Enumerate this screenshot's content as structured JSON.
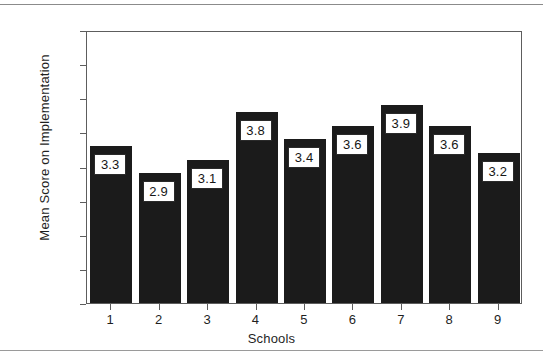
{
  "chart_data": {
    "type": "bar",
    "title": "",
    "xlabel": "Schools",
    "ylabel": "Mean Score on Implementation",
    "categories": [
      "1",
      "2",
      "3",
      "4",
      "5",
      "6",
      "7",
      "8",
      "9"
    ],
    "values": [
      3.3,
      2.9,
      3.1,
      3.8,
      3.4,
      3.6,
      3.9,
      3.6,
      3.2
    ],
    "value_labels": [
      "3.3",
      "2.9",
      "3.1",
      "3.8",
      "3.4",
      "3.6",
      "3.9",
      "3.6",
      "3.2"
    ],
    "ylim": [
      1.0,
      5.0
    ],
    "ytick_labels": [
      "1.0",
      "1.5",
      "2.0",
      "2.5",
      "3.0",
      "3.5",
      "4.0",
      "4.5",
      "5.0"
    ],
    "ytick_values": [
      1.0,
      1.5,
      2.0,
      2.5,
      3.0,
      3.5,
      4.0,
      4.5,
      5.0
    ],
    "grid": false,
    "legend": false,
    "bar_color": "#1b1b1b",
    "label_box_fill": "#ffffff",
    "label_box_border": "#2a2a2a",
    "axis_color": "#5d5d5d",
    "background": "#ffffff"
  },
  "page": {
    "top_rule_color": "#8b8b8b",
    "bottom_rule_color": "#9a9a9a"
  }
}
